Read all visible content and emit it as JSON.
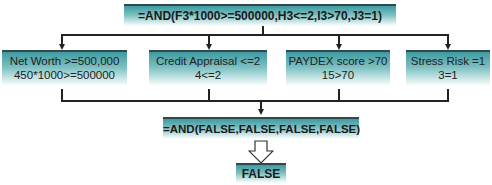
{
  "diagram": {
    "top_formula": "=AND(F3*1000>=500000,H3<=2,I3>70,J3=1)",
    "conditions": [
      {
        "label": "Net Worth >=500,000",
        "evaluation": "450*1000>=500000"
      },
      {
        "label": "Credit Appraisal <=2",
        "evaluation": "4<=2"
      },
      {
        "label": "PAYDEX score >70",
        "evaluation": "15>70"
      },
      {
        "label": "Stress Risk =1",
        "evaluation": "3=1"
      }
    ],
    "evaluated_formula": "=AND(FALSE,FALSE,FALSE,FALSE)",
    "result": "FALSE"
  },
  "colors": {
    "box_top": "#3f9aa0",
    "box_border": "#2e4a4f",
    "connector": "#222222"
  }
}
